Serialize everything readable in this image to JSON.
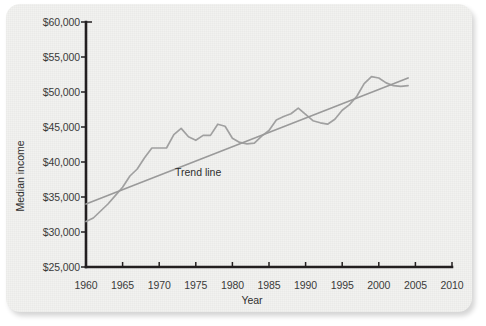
{
  "chart_data": {
    "type": "line",
    "title": "",
    "xlabel": "Year",
    "ylabel": "Median income",
    "xlim": [
      1960,
      2010
    ],
    "ylim": [
      25000,
      60000
    ],
    "xticks": [
      "1960",
      "1965",
      "1970",
      "1975",
      "1980",
      "1985",
      "1990",
      "1995",
      "2000",
      "2005",
      "2010"
    ],
    "yticks": [
      "$25,000",
      "$30,000",
      "$35,000",
      "$40,000",
      "$45,000",
      "$50,000",
      "$55,000",
      "$60,000"
    ],
    "grid": false,
    "legend_position": "inline-annotation",
    "annotations": [
      {
        "text": "Trend line",
        "x": 1976,
        "y": 38600
      }
    ],
    "series": [
      {
        "name": "Median income",
        "color": "#a0a0a0",
        "x": [
          1960,
          1961,
          1962,
          1963,
          1964,
          1965,
          1966,
          1967,
          1968,
          1969,
          1970,
          1971,
          1972,
          1973,
          1974,
          1975,
          1976,
          1977,
          1978,
          1979,
          1980,
          1981,
          1982,
          1983,
          1984,
          1985,
          1986,
          1987,
          1988,
          1989,
          1990,
          1991,
          1992,
          1993,
          1994,
          1995,
          1996,
          1997,
          1998,
          1999,
          2000,
          2001,
          2002,
          2003,
          2004
        ],
        "values": [
          31500,
          32000,
          33000,
          34000,
          35200,
          36400,
          38000,
          39000,
          40600,
          42000,
          42000,
          42000,
          43900,
          44800,
          43600,
          43100,
          43800,
          43800,
          45400,
          45100,
          43400,
          42800,
          42600,
          42700,
          43700,
          44500,
          46000,
          46500,
          46900,
          47700,
          46800,
          45900,
          45600,
          45400,
          46100,
          47400,
          48200,
          49400,
          51200,
          52200,
          52000,
          51300,
          50900,
          50800,
          50900
        ]
      },
      {
        "name": "Trend line",
        "color": "#9a9a9a",
        "x": [
          1960,
          2004
        ],
        "values": [
          34000,
          52000
        ]
      }
    ]
  },
  "card": {
    "background_color": "#f2f2f0",
    "accent_color": "#231f20"
  }
}
